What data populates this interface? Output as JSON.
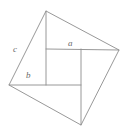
{
  "figure": {
    "stroke_color": "#8c8c8c",
    "label_color": "#6b6b6b",
    "background_color": "#ffffff",
    "width": 128,
    "height": 134,
    "labels": {
      "a": "a",
      "b": "b",
      "c": "c"
    },
    "label_positions": {
      "a": {
        "x": 68,
        "y": 39
      },
      "b": {
        "x": 26,
        "y": 71
      },
      "c": {
        "x": 13,
        "y": 45
      }
    },
    "vertices": {
      "top": {
        "x": 46,
        "y": 11
      },
      "right": {
        "x": 119,
        "y": 50
      },
      "bottom": {
        "x": 81,
        "y": 125
      },
      "left": {
        "x": 9,
        "y": 85
      }
    },
    "outer_polygon_points": "46,11 119,50 81,125 9,85",
    "inner_lines": [
      {
        "name": "vertical-from-apex",
        "x1": 46,
        "y1": 11,
        "x2": 46,
        "y2": 85
      },
      {
        "name": "vertical-to-bottom-vertex",
        "x1": 81,
        "y1": 49,
        "x2": 81,
        "y2": 125
      },
      {
        "name": "horizontal-upper",
        "x1": 46,
        "y1": 49,
        "x2": 119,
        "y2": 50
      },
      {
        "name": "horizontal-lower",
        "x1": 9,
        "y1": 85,
        "x2": 81,
        "y2": 85
      }
    ]
  }
}
